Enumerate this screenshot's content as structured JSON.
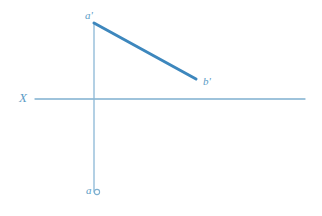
{
  "drawing": {
    "title": "Point and line orthographic projection",
    "background_color": "#ffffff",
    "width": 322,
    "height": 216,
    "colors": {
      "axis_line": "#7fb0d0",
      "projection_line": "#8ab7d6",
      "object_line": "#3d87bd",
      "label_text": "#5b9cc6",
      "marker_stroke": "#7fb0d0"
    },
    "axis": {
      "label": "X",
      "name": "ground-line-x",
      "x1": 35,
      "y1": 99,
      "x2": 305,
      "y2": 99,
      "stroke_width": 1.3
    },
    "projector": {
      "name": "vertical-projection-line",
      "x1": 94,
      "y1": 23,
      "x2": 94,
      "y2": 192,
      "stroke_width": 1.3
    },
    "object_line": {
      "name": "line-ab-frontal-view",
      "from_label": "a'",
      "to_label": "b'",
      "x1": 94,
      "y1": 23,
      "x2": 196,
      "y2": 79,
      "stroke_width": 3.0
    },
    "points": [
      {
        "id": "a-prime",
        "label": "a'",
        "x": 94,
        "y": 23,
        "marker": "none",
        "description": "frontal projection of point A"
      },
      {
        "id": "b-prime",
        "label": "b'",
        "x": 196,
        "y": 79,
        "marker": "none",
        "description": "frontal projection of point B"
      },
      {
        "id": "a-horizontal",
        "label": "a",
        "x": 97,
        "y": 192,
        "marker": "circle",
        "marker_radius": 2.6,
        "description": "horizontal projection of point A"
      }
    ]
  }
}
